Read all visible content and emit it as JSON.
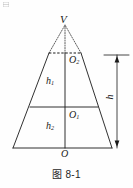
{
  "figure": {
    "caption": "图 8-1",
    "type": "geometry-diagram",
    "stroke_color": "#1a1a1a",
    "background_color": "#fefefe",
    "labels": {
      "apex": "V",
      "upper_center": "O",
      "upper_center_sub": "2",
      "upper_height": "h",
      "upper_height_sub": "1",
      "lower_center": "O",
      "lower_center_sub": "1",
      "lower_height": "h",
      "lower_height_sub": "2",
      "origin": "O",
      "total_height": "h"
    },
    "geometry": {
      "apex_x": 65,
      "apex_y": 24,
      "base_left_x": 13,
      "base_right_x": 112,
      "base_y": 148,
      "top_left_x": 49,
      "top_right_x": 81,
      "top_y": 53,
      "mid_left_x": 30,
      "mid_right_x": 98,
      "mid_y": 107,
      "axis_x": 65,
      "dimension_x": 117,
      "dimension_top_y": 55,
      "dimension_bottom_y": 148
    }
  }
}
